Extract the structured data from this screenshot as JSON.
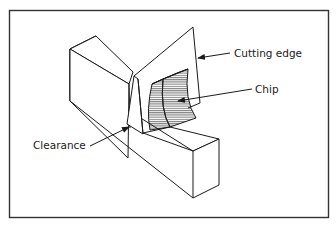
{
  "figure": {
    "type": "orthogonal-cutting-illustration",
    "frame_color": "#333333",
    "line_color": "#1a1a1a",
    "labels": {
      "cutting_edge": "Cutting edge",
      "chip": "Chip",
      "clearance": "Clearance"
    }
  }
}
